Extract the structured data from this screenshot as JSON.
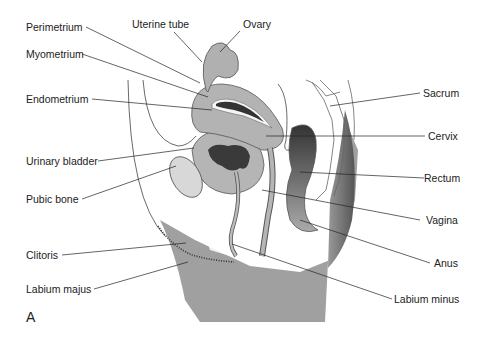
{
  "figure": {
    "panel_letter": "A",
    "labels_left": [
      {
        "id": "perimetrium",
        "text": "Perimetrium"
      },
      {
        "id": "myometrium",
        "text": "Myometrium"
      },
      {
        "id": "endometrium",
        "text": "Endometrium"
      },
      {
        "id": "urinary-bladder",
        "text": "Urinary bladder"
      },
      {
        "id": "pubic-bone",
        "text": "Pubic bone"
      },
      {
        "id": "clitoris",
        "text": "Clitoris"
      },
      {
        "id": "labium-majus",
        "text": "Labium majus"
      }
    ],
    "labels_top": [
      {
        "id": "uterine-tube",
        "text": "Uterine tube"
      },
      {
        "id": "ovary",
        "text": "Ovary"
      }
    ],
    "labels_right": [
      {
        "id": "sacrum",
        "text": "Sacrum"
      },
      {
        "id": "cervix",
        "text": "Cervix"
      },
      {
        "id": "rectum",
        "text": "Rectum"
      },
      {
        "id": "vagina",
        "text": "Vagina"
      },
      {
        "id": "anus",
        "text": "Anus"
      },
      {
        "id": "labium-minus",
        "text": "Labium minus"
      }
    ]
  }
}
